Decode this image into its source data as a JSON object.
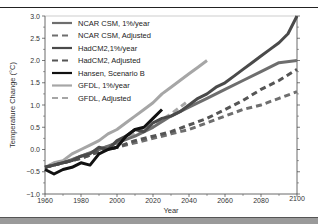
{
  "chart_data": {
    "type": "line",
    "title": "",
    "xlabel": "Year",
    "ylabel": "Temperature Change (°C)",
    "xlim": [
      1960,
      2100
    ],
    "ylim": [
      -1.0,
      3.0
    ],
    "x_ticks": [
      1960,
      1980,
      2000,
      2020,
      2040,
      2060,
      2080,
      2100
    ],
    "y_ticks": [
      -1.0,
      -0.5,
      0.0,
      0.5,
      1.0,
      1.5,
      2.0,
      2.5,
      3.0
    ],
    "y_tick_labels": [
      "−1.0",
      "−0.5",
      "0.0",
      "0.5",
      "1.0",
      "1.5",
      "2.0",
      "2.5",
      "3.0"
    ],
    "grid": false,
    "legend_position": "upper left",
    "series": [
      {
        "name": "NCAR CSM, 1%/year",
        "style": "solid",
        "color": "#6e6e6e",
        "width": 3,
        "x": [
          1960,
          1970,
          1980,
          1990,
          2000,
          2010,
          2020,
          2030,
          2040,
          2050,
          2060,
          2070,
          2080,
          2090,
          2100
        ],
        "values": [
          -0.4,
          -0.3,
          -0.15,
          0.0,
          0.15,
          0.3,
          0.5,
          0.75,
          0.95,
          1.15,
          1.35,
          1.55,
          1.75,
          1.95,
          2.0
        ]
      },
      {
        "name": "NCAR CSM, Adjusted",
        "style": "dashed",
        "color": "#6e6e6e",
        "width": 3,
        "x": [
          1960,
          1970,
          1980,
          1990,
          2000,
          2010,
          2020,
          2030,
          2040,
          2050,
          2060,
          2070,
          2080,
          2090,
          2100
        ],
        "values": [
          -0.4,
          -0.3,
          -0.2,
          -0.05,
          0.05,
          0.15,
          0.25,
          0.35,
          0.45,
          0.6,
          0.75,
          0.9,
          1.0,
          1.15,
          1.3
        ]
      },
      {
        "name": "HadCM2,1%/year",
        "style": "solid",
        "color": "#4a4a4a",
        "width": 3,
        "x": [
          1960,
          1965,
          1970,
          1975,
          1980,
          1985,
          1990,
          1995,
          2000,
          2005,
          2010,
          2015,
          2020,
          2025,
          2030,
          2035,
          2040,
          2045,
          2050,
          2055,
          2060,
          2065,
          2070,
          2075,
          2080,
          2085,
          2090,
          2095,
          2100
        ],
        "values": [
          -0.4,
          -0.35,
          -0.3,
          -0.25,
          -0.15,
          -0.1,
          0.05,
          0.0,
          0.2,
          0.3,
          0.45,
          0.4,
          0.6,
          0.7,
          0.75,
          0.85,
          1.0,
          1.15,
          1.25,
          1.4,
          1.5,
          1.65,
          1.8,
          1.95,
          2.1,
          2.25,
          2.4,
          2.6,
          3.0
        ]
      },
      {
        "name": "HadCM2, Adjusted",
        "style": "dashed",
        "color": "#555555",
        "width": 3,
        "x": [
          1960,
          1970,
          1980,
          1990,
          2000,
          2010,
          2020,
          2030,
          2040,
          2050,
          2060,
          2070,
          2080,
          2090,
          2100
        ],
        "values": [
          -0.4,
          -0.3,
          -0.2,
          -0.05,
          0.05,
          0.2,
          0.3,
          0.4,
          0.55,
          0.7,
          0.9,
          1.1,
          1.35,
          1.55,
          1.8
        ]
      },
      {
        "name": "Hansen, Scenario B",
        "style": "solid",
        "color": "#111111",
        "width": 3,
        "x": [
          1960,
          1965,
          1970,
          1975,
          1980,
          1985,
          1990,
          1995,
          2000,
          2005,
          2010,
          2015,
          2020,
          2025
        ],
        "values": [
          -0.45,
          -0.55,
          -0.45,
          -0.4,
          -0.3,
          -0.35,
          -0.1,
          0.0,
          0.05,
          0.3,
          0.45,
          0.5,
          0.7,
          0.9
        ]
      },
      {
        "name": "GFDL, 1%/year",
        "style": "solid",
        "color": "#a6a6a6",
        "width": 3,
        "x": [
          1960,
          1965,
          1970,
          1975,
          1980,
          1985,
          1990,
          1995,
          2000,
          2005,
          2010,
          2015,
          2020,
          2025,
          2030,
          2035,
          2040,
          2045,
          2050
        ],
        "values": [
          -0.4,
          -0.3,
          -0.25,
          -0.1,
          0.0,
          0.1,
          0.2,
          0.35,
          0.45,
          0.6,
          0.75,
          0.9,
          1.05,
          1.25,
          1.4,
          1.55,
          1.7,
          1.85,
          2.0
        ]
      },
      {
        "name": "GFDL, Adjusted",
        "style": "dashed",
        "color": "#a6a6a6",
        "width": 3,
        "x": [
          1960,
          1970,
          1980,
          1990,
          2000,
          2010,
          2020,
          2030,
          2040
        ],
        "values": [
          -0.4,
          -0.3,
          -0.15,
          0.0,
          0.15,
          0.35,
          0.55,
          0.8,
          1.1
        ]
      }
    ]
  }
}
